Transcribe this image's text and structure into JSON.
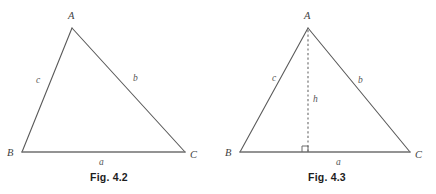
{
  "page": {
    "background": "#ffffff",
    "width": 436,
    "height": 194
  },
  "style": {
    "stroke_color": "#5a5a5a",
    "base_stroke_color": "#707070",
    "dashed_stroke_color": "#6a6a6a",
    "label_color": "#4a4a4a",
    "caption_color": "#1d1d1d"
  },
  "figures": [
    {
      "id": "fig-4-2",
      "caption": "Fig. 4.2",
      "vertices": {
        "A": {
          "label": "A",
          "x": 72,
          "y": 28
        },
        "B": {
          "label": "B",
          "x": 22,
          "y": 152
        },
        "C": {
          "label": "C",
          "x": 185,
          "y": 152
        }
      },
      "vertex_labels": {
        "A": {
          "text": "A",
          "x": 68,
          "y": 11
        },
        "B": {
          "text": "B",
          "x": 7,
          "y": 148
        },
        "C": {
          "text": "C",
          "x": 190,
          "y": 150
        }
      },
      "side_labels": {
        "c": {
          "text": "c",
          "x": 36,
          "y": 76
        },
        "b": {
          "text": "b",
          "x": 133,
          "y": 74
        },
        "a": {
          "text": "a",
          "x": 99,
          "y": 158
        }
      },
      "has_altitude": false
    },
    {
      "id": "fig-4-3",
      "caption": "Fig. 4.3",
      "vertices": {
        "A": {
          "label": "A",
          "x": 90,
          "y": 28
        },
        "B": {
          "label": "B",
          "x": 22,
          "y": 152
        },
        "C": {
          "label": "C",
          "x": 192,
          "y": 152
        }
      },
      "vertex_labels": {
        "A": {
          "text": "A",
          "x": 86,
          "y": 11
        },
        "B": {
          "text": "B",
          "x": 7,
          "y": 148
        },
        "C": {
          "text": "C",
          "x": 197,
          "y": 150
        }
      },
      "side_labels": {
        "c": {
          "text": "c",
          "x": 54,
          "y": 74
        },
        "b": {
          "text": "b",
          "x": 140,
          "y": 76
        },
        "a": {
          "text": "a",
          "x": 118,
          "y": 158
        }
      },
      "has_altitude": true,
      "altitude": {
        "label": "h",
        "label_x": 95,
        "label_y": 95,
        "foot_x": 90,
        "foot_y": 152,
        "top_x": 90,
        "top_y": 28,
        "right_angle_marker": {
          "x": 84,
          "y": 146,
          "size": 6
        }
      }
    }
  ]
}
